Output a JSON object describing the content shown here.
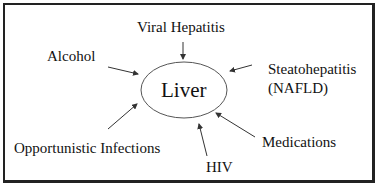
{
  "diagram": {
    "center": {
      "label": "Liver"
    },
    "factors": [
      {
        "id": "viral-hepatitis",
        "label": "Viral Hepatitis"
      },
      {
        "id": "alcohol",
        "label": "Alcohol"
      },
      {
        "id": "steatohepatitis",
        "label": "Steatohepatitis",
        "sub": "(NAFLD)"
      },
      {
        "id": "opportunistic-infections",
        "label": "Opportunistic Infections"
      },
      {
        "id": "hiv",
        "label": "HIV"
      },
      {
        "id": "medications",
        "label": "Medications"
      }
    ]
  }
}
